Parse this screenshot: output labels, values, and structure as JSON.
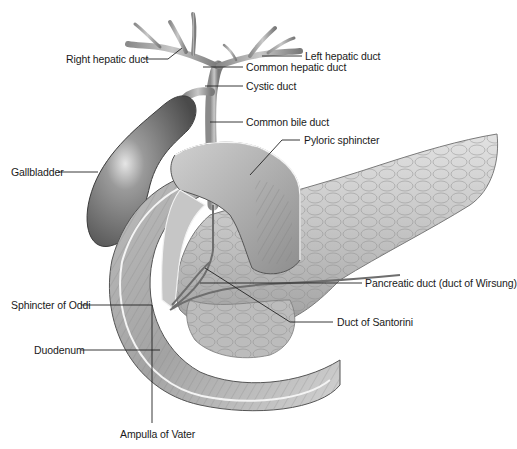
{
  "figure": {
    "style": "grayscale medical illustration",
    "colors": {
      "background": "#ffffff",
      "ink": "#1a1a1a",
      "organ_dark": "#5a5a5a",
      "organ_mid": "#9a9a9a",
      "organ_light": "#d8d8d8"
    }
  },
  "labels": [
    {
      "id": "right-hepatic-duct",
      "text": "Right hepatic duct"
    },
    {
      "id": "left-hepatic-duct",
      "text": "Left hepatic duct"
    },
    {
      "id": "common-hepatic-duct",
      "text": "Common hepatic duct"
    },
    {
      "id": "cystic-duct",
      "text": "Cystic duct"
    },
    {
      "id": "common-bile-duct",
      "text": "Common bile duct"
    },
    {
      "id": "pyloric-sphincter",
      "text": "Pyloric sphincter"
    },
    {
      "id": "gallbladder",
      "text": "Gallbladder"
    },
    {
      "id": "pancreatic-duct",
      "text": "Pancreatic duct (duct of Wirsung)"
    },
    {
      "id": "sphincter-of-oddi",
      "text": "Sphincter of Oddi"
    },
    {
      "id": "duct-of-santorini",
      "text": "Duct of Santorini"
    },
    {
      "id": "duodenum",
      "text": "Duodenum"
    },
    {
      "id": "ampulla-of-vater",
      "text": "Ampulla of Vater"
    }
  ]
}
